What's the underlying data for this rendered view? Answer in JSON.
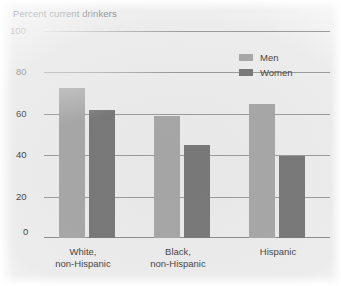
{
  "chart_data": {
    "type": "bar",
    "title": "Percent current drinkers",
    "xlabel": "",
    "ylabel": "Percent current drinkers",
    "ylim": [
      0,
      100
    ],
    "yticks": [
      100,
      80,
      60,
      40,
      20,
      0
    ],
    "grid": true,
    "legend_position": "top-right",
    "categories": [
      "White, non-Hispanic",
      "Black, non-Hispanic",
      "Hispanic"
    ],
    "category_lines": [
      {
        "line1": "White,",
        "line2": "non-Hispanic"
      },
      {
        "line1": "Black,",
        "line2": "non-Hispanic"
      },
      {
        "line1": "Hispanic",
        "line2": ""
      }
    ],
    "series": [
      {
        "name": "Men",
        "color": "#a9a9a9",
        "values": [
          73,
          59,
          65
        ]
      },
      {
        "name": "Women",
        "color": "#6f6f6f",
        "values": [
          62,
          45,
          40
        ]
      }
    ]
  },
  "legend": {
    "items": [
      {
        "label": "Men",
        "color": "#a9a9a9"
      },
      {
        "label": "Women",
        "color": "#6f6f6f"
      }
    ]
  },
  "axis": {
    "y_tick_labels": [
      "100",
      "80",
      "60",
      "40",
      "20",
      "0"
    ]
  }
}
